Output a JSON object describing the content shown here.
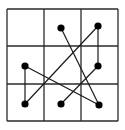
{
  "diagram": {
    "type": "3x3 grid with connected dots",
    "width": 125,
    "height": 130,
    "colors": {
      "background": "#ffffff",
      "grid": "#2a2a2a",
      "line": "#1a1a1a",
      "dot": "#000000"
    },
    "grid": {
      "rows": 3,
      "cols": 3,
      "x": [
        7,
        44,
        81,
        118
      ],
      "y": [
        9,
        46,
        84,
        121
      ]
    },
    "dots": [
      {
        "id": "r1c2",
        "row": 1,
        "col": 2,
        "x": 61,
        "y": 28
      },
      {
        "id": "r1c3",
        "row": 1,
        "col": 3,
        "x": 98,
        "y": 26
      },
      {
        "id": "r2c1",
        "row": 2,
        "col": 1,
        "x": 25,
        "y": 66
      },
      {
        "id": "r2c3",
        "row": 2,
        "col": 3,
        "x": 98,
        "y": 66
      },
      {
        "id": "r3c1",
        "row": 3,
        "col": 1,
        "x": 25,
        "y": 104
      },
      {
        "id": "r3c2",
        "row": 3,
        "col": 2,
        "x": 61,
        "y": 104
      },
      {
        "id": "r3c3",
        "row": 3,
        "col": 3,
        "x": 99,
        "y": 105
      }
    ],
    "connections": [
      {
        "from": "r1c2",
        "to": "r3c3"
      },
      {
        "from": "r1c3",
        "to": "r2c3"
      },
      {
        "from": "r1c3",
        "to": "r3c1"
      },
      {
        "from": "r2c1",
        "to": "r3c1"
      },
      {
        "from": "r2c1",
        "to": "r3c3"
      },
      {
        "from": "r2c3",
        "to": "r3c2"
      }
    ]
  }
}
